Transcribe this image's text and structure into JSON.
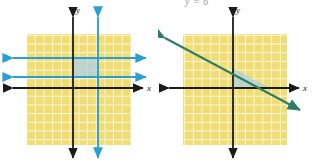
{
  "figure": {
    "title_fragment": "y = 6",
    "background": "#ffffff"
  },
  "colors": {
    "grid_fill": "#f0dd74",
    "grid_line": "#ffffff",
    "axis": "#1a1a1a",
    "blue_line": "#2a9fd4",
    "blue_shade": "#a9cfe6",
    "green_line": "#2f7d63",
    "label": "#1a1a1a",
    "faint_text": "#9a9a9a"
  },
  "panels": [
    {
      "id": "left-panel",
      "name": "left-graph",
      "x_axis_label": "x",
      "y_axis_label": "y",
      "grid": {
        "left": 27,
        "top": 34,
        "width": 104,
        "height": 111,
        "cell": 8.7
      },
      "axes": {
        "x_axis_y": 88,
        "y_axis_x": 73
      },
      "boundary_lines": [
        {
          "kind": "horizontal",
          "y": 58,
          "color": "#2a9fd4",
          "arrows": "both"
        },
        {
          "kind": "horizontal",
          "y": 77,
          "color": "#2a9fd4",
          "arrows": "both"
        },
        {
          "kind": "vertical",
          "x": 98,
          "color": "#2a9fd4",
          "arrows": "both"
        }
      ],
      "solution_region": {
        "shape": "rectangle",
        "left": 73,
        "top": 58,
        "right": 98,
        "bottom": 77
      }
    },
    {
      "id": "right-panel",
      "name": "right-graph",
      "x_axis_label": "x",
      "y_axis_label": "y",
      "grid": {
        "left": 25,
        "top": 34,
        "width": 104,
        "height": 111,
        "cell": 8.7
      },
      "axes": {
        "x_axis_y": 88,
        "y_axis_x": 75
      },
      "boundary_lines": [
        {
          "kind": "oblique",
          "x1": 7,
          "y1": 38,
          "x2": 142,
          "y2": 110,
          "color": "#2f7d63",
          "arrows": "both"
        }
      ],
      "solution_region": {
        "shape": "triangle",
        "points": "75,88 75,68 112,88"
      }
    }
  ]
}
